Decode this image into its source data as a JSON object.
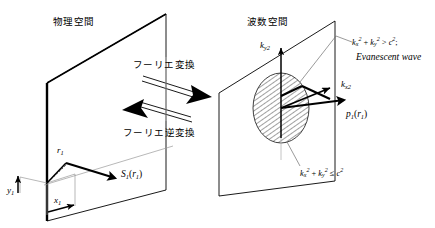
{
  "figure": {
    "type": "schematic-diagram",
    "background": "#ffffff",
    "stroke": "#000000",
    "hatch_color": "#333333"
  },
  "left_panel": {
    "title": "物理空間",
    "plane_label": "physical-space-plane",
    "labels": {
      "r1": "r",
      "r1_sub": "1",
      "y1": "y",
      "y1_sub": "1",
      "x1": "x",
      "x1_sub": "1",
      "s1_name": "S",
      "s1_sub": "1",
      "s1_arg_open": "(",
      "s1_arg": "r",
      "s1_arg_sub": "1",
      "s1_arg_close": ")"
    }
  },
  "center": {
    "forward_label": "フーリエ変換",
    "inverse_label": "フーリエ逆変換"
  },
  "right_panel": {
    "title": "波数空間",
    "plane_label": "wavenumber-space-plane",
    "axis_y": "k",
    "axis_y_sub": "y2",
    "axis_x": "k",
    "axis_x_sub": "x2",
    "p1_name": "p",
    "p1_sub": "1",
    "p1_arg_open": "(",
    "p1_arg": "r",
    "p1_arg_sub": "1",
    "p1_arg_close": ")",
    "evanescent_text": "Evanescent wave",
    "formula_evanescent": {
      "k": "k",
      "subx": "x",
      "suby": "y",
      "sq": "2",
      "plus": " + ",
      "gt": " > ",
      "c": "c",
      "semi": ";"
    },
    "formula_propagating": {
      "k": "k",
      "subx": "x",
      "suby": "y",
      "sq": "2",
      "plus": " + ",
      "le": " ≤ ",
      "c": "c"
    },
    "region_hatched": "propagating-wave-region"
  }
}
